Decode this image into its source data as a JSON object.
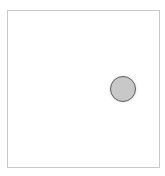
{
  "canvas": {
    "border_color": "#c8c8c8",
    "background": "#ffffff"
  },
  "circle": {
    "fill_color": "#c8c8c8",
    "stroke_color": "#5e5e5e",
    "diameter_px": 26,
    "center_px": [
      123,
      89
    ]
  }
}
